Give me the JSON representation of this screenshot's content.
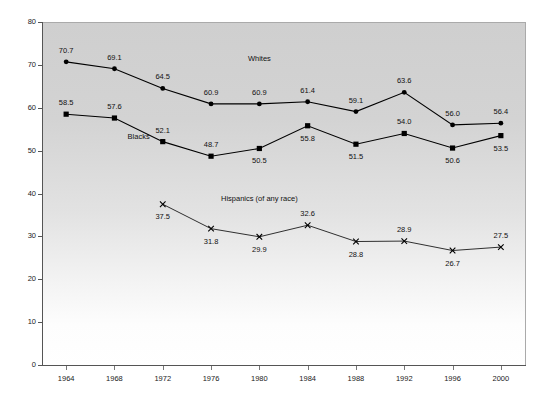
{
  "chart_data": {
    "type": "line",
    "title": "",
    "xlabel": "",
    "ylabel": "",
    "xlim": [
      1962,
      2002
    ],
    "ylim": [
      0,
      80
    ],
    "ytick_step": 10,
    "grid": false,
    "legend": "inline-labels",
    "categories": [
      1964,
      1968,
      1972,
      1976,
      1980,
      1984,
      1988,
      1992,
      1996,
      2000
    ],
    "xticks": [
      "1964",
      "1968",
      "1972",
      "1976",
      "1980",
      "1984",
      "1988",
      "1992",
      "1996",
      "2000"
    ],
    "yticks": [
      "0",
      "10",
      "20",
      "30",
      "40",
      "50",
      "60",
      "70",
      "80"
    ],
    "series": [
      {
        "name": "Whites",
        "marker": "circle",
        "color": "#000000",
        "x": [
          1964,
          1968,
          1972,
          1976,
          1980,
          1984,
          1988,
          1992,
          1996,
          2000
        ],
        "values": [
          70.7,
          69.1,
          64.5,
          60.9,
          60.9,
          61.4,
          59.1,
          63.6,
          56.0,
          56.4
        ],
        "labels": [
          "70.7",
          "69.1",
          "64.5",
          "60.9",
          "60.9",
          "61.4",
          "59.1",
          "63.6",
          "56.0",
          "56.4"
        ],
        "label_positions": [
          "above",
          "above",
          "above",
          "above",
          "above",
          "above",
          "above",
          "above",
          "above",
          "above"
        ],
        "name_label_x": 1980,
        "name_label_y": 71.5
      },
      {
        "name": "Blacks",
        "marker": "square",
        "color": "#000000",
        "x": [
          1964,
          1968,
          1972,
          1976,
          1980,
          1984,
          1988,
          1992,
          1996,
          2000
        ],
        "values": [
          58.5,
          57.6,
          52.1,
          48.7,
          50.5,
          55.8,
          51.5,
          54.0,
          50.6,
          53.5
        ],
        "labels": [
          "58.5",
          "57.6",
          "52.1",
          "48.7",
          "50.5",
          "55.8",
          "51.5",
          "54.0",
          "50.6",
          "53.5"
        ],
        "label_positions": [
          "above",
          "above",
          "above",
          "above",
          "below",
          "below",
          "below",
          "above",
          "below",
          "below"
        ],
        "name_label_x": 1970,
        "name_label_y": 53.5
      },
      {
        "name": "Hispanics (of any race)",
        "marker": "cross",
        "color": "#000000",
        "x": [
          1972,
          1976,
          1980,
          1984,
          1988,
          1992,
          1996,
          2000
        ],
        "values": [
          37.5,
          31.8,
          29.9,
          32.6,
          28.8,
          28.9,
          26.7,
          27.5
        ],
        "labels": [
          "37.5",
          "31.8",
          "29.9",
          "32.6",
          "28.8",
          "28.9",
          "26.7",
          "27.5"
        ],
        "label_positions": [
          "below",
          "below",
          "below",
          "above",
          "below",
          "above",
          "below",
          "above"
        ],
        "name_label_x": 1980,
        "name_label_y": 39.0
      }
    ]
  },
  "colors": {
    "line": "#111111",
    "marker": "#000000",
    "axis": "#555555",
    "plot_bg_top": "#cfcfcf",
    "plot_bg_bottom": "#ffffff",
    "text": "#111111"
  }
}
